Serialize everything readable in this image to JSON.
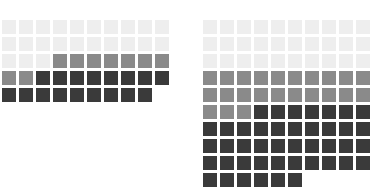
{
  "chart_data": [
    {
      "id": "waffle-left",
      "type": "waffle",
      "title": "",
      "xlabel": "",
      "ylabel": "",
      "columns": 10,
      "rows": 5,
      "unit_value": 1,
      "total_units": 49,
      "legend": [
        {
          "name": "low",
          "color": "#eeeeee"
        },
        {
          "name": "medium",
          "color": "#8a8a8a"
        },
        {
          "name": "high",
          "color": "#3a3a3a"
        }
      ],
      "categories": [
        "low",
        "medium",
        "high"
      ],
      "values": [
        23,
        9,
        17
      ],
      "grid": [
        [
          "low",
          "low",
          "low",
          "low",
          "low",
          "low",
          "low",
          "low",
          "low",
          "low"
        ],
        [
          "low",
          "low",
          "low",
          "low",
          "low",
          "low",
          "low",
          "low",
          "low",
          "low"
        ],
        [
          "low",
          "low",
          "low",
          "medium",
          "medium",
          "medium",
          "medium",
          "medium",
          "medium",
          "medium"
        ],
        [
          "medium",
          "medium",
          "high",
          "high",
          "high",
          "high",
          "high",
          "high",
          "high",
          "high"
        ],
        [
          "high",
          "high",
          "high",
          "high",
          "high",
          "high",
          "high",
          "high",
          "high"
        ]
      ]
    },
    {
      "id": "waffle-right",
      "type": "waffle",
      "title": "",
      "xlabel": "",
      "ylabel": "",
      "columns": 10,
      "rows": 10,
      "unit_value": 1,
      "total_units": 96,
      "legend": [
        {
          "name": "low",
          "color": "#eeeeee"
        },
        {
          "name": "medium",
          "color": "#8a8a8a"
        },
        {
          "name": "high",
          "color": "#3a3a3a"
        }
      ],
      "categories": [
        "low",
        "medium",
        "high"
      ],
      "values": [
        30,
        23,
        43
      ],
      "grid": [
        [
          "low",
          "low",
          "low",
          "low",
          "low",
          "low",
          "low",
          "low",
          "low",
          "low"
        ],
        [
          "low",
          "low",
          "low",
          "low",
          "low",
          "low",
          "low",
          "low",
          "low",
          "low"
        ],
        [
          "low",
          "low",
          "low",
          "low",
          "low",
          "low",
          "low",
          "low",
          "low",
          "low"
        ],
        [
          "medium",
          "medium",
          "medium",
          "medium",
          "medium",
          "medium",
          "medium",
          "medium",
          "medium",
          "medium"
        ],
        [
          "medium",
          "medium",
          "medium",
          "medium",
          "medium",
          "medium",
          "medium",
          "medium",
          "medium",
          "medium"
        ],
        [
          "medium",
          "medium",
          "medium",
          "high",
          "high",
          "high",
          "high",
          "high",
          "high",
          "high"
        ],
        [
          "high",
          "high",
          "high",
          "high",
          "high",
          "high",
          "high",
          "high",
          "high",
          "high"
        ],
        [
          "high",
          "high",
          "high",
          "high",
          "high",
          "high",
          "high",
          "high",
          "high",
          "high"
        ],
        [
          "high",
          "high",
          "high",
          "high",
          "high",
          "high",
          "high",
          "high",
          "high",
          "high"
        ],
        [
          "high",
          "high",
          "high",
          "high",
          "high",
          "high"
        ]
      ]
    }
  ],
  "colors": {
    "background": "#ffffff",
    "low": "#eeeeee",
    "medium": "#8a8a8a",
    "high": "#3a3a3a"
  }
}
